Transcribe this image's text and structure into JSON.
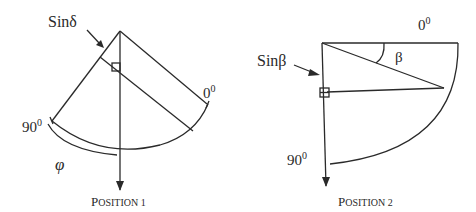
{
  "diagram": {
    "position1": {
      "caption_first": "P",
      "caption_rest": "OSITION 1",
      "pointer_label_prefix": "Sin",
      "pointer_label_symbol": "δ",
      "angle_start_label": "0",
      "angle_start_sup": "0",
      "angle_end_label": "90",
      "angle_end_sup": "0",
      "arc_label": "φ"
    },
    "position2": {
      "caption_first": "P",
      "caption_rest": "OSITION 2",
      "pointer_label_prefix": "Sin",
      "pointer_label_symbol": "β",
      "angle_start_label": "0",
      "angle_start_sup": "0",
      "angle_end_label": "90",
      "angle_end_sup": "0",
      "angle_label": "β"
    },
    "colors": {
      "stroke": "#2a2a2a",
      "background": "#ffffff"
    }
  }
}
